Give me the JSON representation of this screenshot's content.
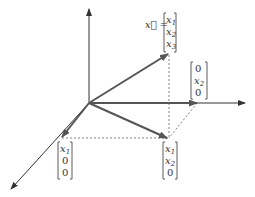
{
  "diagram": {
    "vector_label": "x⃗ =",
    "vector_x": [
      "x1",
      "x2",
      "x3"
    ],
    "projection_xy": [
      "x1",
      "x2",
      "0"
    ],
    "component_x1": [
      "x1",
      "0",
      "0"
    ],
    "component_x2": [
      "0",
      "x2",
      "0"
    ],
    "colors": {
      "axis": "#333333",
      "vector": "#555555",
      "dashed": "#666666"
    }
  }
}
